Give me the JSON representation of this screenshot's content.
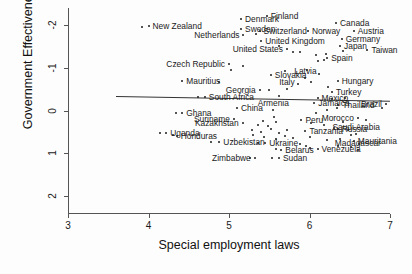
{
  "chart_data": {
    "type": "scatter",
    "title": "",
    "xlabel": "Special employment laws",
    "ylabel": "Government Effectiveness",
    "xlim": [
      3,
      7
    ],
    "ylim": [
      -2.4,
      2.4
    ],
    "xticks": [
      3,
      4,
      5,
      6,
      7
    ],
    "yticks": [
      -2,
      -1,
      0,
      1,
      2
    ],
    "grid": false,
    "legend": "none",
    "fit_line": {
      "type": "linear",
      "x_start": 3.6,
      "x_end": 7.0,
      "y_start": 0.33,
      "y_end": 0.22
    },
    "points": [
      {
        "label": "New Zealand",
        "x": 4.0,
        "y": 1.97,
        "label_pos": "left"
      },
      {
        "label": "Denmark",
        "x": 5.15,
        "y": 2.14,
        "label_pos": "left"
      },
      {
        "label": "Finland",
        "x": 5.47,
        "y": 2.22,
        "label_pos": "left"
      },
      {
        "label": "Sweden",
        "x": 5.15,
        "y": 1.92,
        "label_pos": "left"
      },
      {
        "label": "Netherlands",
        "x": 5.18,
        "y": 1.77,
        "label_pos": "right"
      },
      {
        "label": "Switzerland",
        "x": 5.38,
        "y": 1.86,
        "label_pos": "left"
      },
      {
        "label": "Norway",
        "x": 5.98,
        "y": 1.86,
        "label_pos": "left"
      },
      {
        "label": "Canada",
        "x": 6.33,
        "y": 2.05,
        "label_pos": "left"
      },
      {
        "label": "Austria",
        "x": 6.55,
        "y": 1.86,
        "label_pos": "left"
      },
      {
        "label": "Germany",
        "x": 6.4,
        "y": 1.68,
        "label_pos": "left"
      },
      {
        "label": "Japan",
        "x": 6.38,
        "y": 1.5,
        "label_pos": "left"
      },
      {
        "label": "Taiwan",
        "x": 6.72,
        "y": 1.42,
        "label_pos": "left"
      },
      {
        "label": "United Kingdom",
        "x": 5.4,
        "y": 1.62,
        "label_pos": "left"
      },
      {
        "label": "United States",
        "x": 5.72,
        "y": 1.44,
        "label_pos": "right"
      },
      {
        "label": "Spain",
        "x": 6.22,
        "y": 1.24,
        "label_pos": "left"
      },
      {
        "label": "Czech Republic",
        "x": 5.0,
        "y": 1.08,
        "label_pos": "right"
      },
      {
        "label": "Slovakia",
        "x": 5.52,
        "y": 0.84,
        "label_pos": "left"
      },
      {
        "label": "Latvia",
        "x": 5.95,
        "y": 0.75,
        "label_pos": "mid"
      },
      {
        "label": "Hungary",
        "x": 6.35,
        "y": 0.7,
        "label_pos": "left"
      },
      {
        "label": "Mauritius",
        "x": 4.42,
        "y": 0.68,
        "label_pos": "left"
      },
      {
        "label": "Georgia",
        "x": 5.38,
        "y": 0.48,
        "label_pos": "right"
      },
      {
        "label": "Italy",
        "x": 5.72,
        "y": 0.5,
        "label_pos": "mid"
      },
      {
        "label": "Turkey",
        "x": 6.28,
        "y": 0.43,
        "label_pos": "left"
      },
      {
        "label": "Mexico",
        "x": 6.1,
        "y": 0.29,
        "label_pos": "left"
      },
      {
        "label": "South Africa",
        "x": 4.7,
        "y": 0.32,
        "label_pos": "left"
      },
      {
        "label": "Jamaica",
        "x": 6.06,
        "y": 0.18,
        "label_pos": "left"
      },
      {
        "label": "Thailand",
        "x": 6.36,
        "y": 0.14,
        "label_pos": "left"
      },
      {
        "label": "Brazil",
        "x": 6.95,
        "y": 0.16,
        "label_pos": "right"
      },
      {
        "label": "China",
        "x": 5.1,
        "y": 0.07,
        "label_pos": "left"
      },
      {
        "label": "Armenia",
        "x": 5.55,
        "y": 0.02,
        "label_pos": "mid"
      },
      {
        "label": "Ghana",
        "x": 4.42,
        "y": -0.06,
        "label_pos": "left"
      },
      {
        "label": "Suriname",
        "x": 5.06,
        "y": -0.2,
        "label_pos": "right"
      },
      {
        "label": "Kazakhstan",
        "x": 5.17,
        "y": -0.3,
        "label_pos": "right"
      },
      {
        "label": "Peru",
        "x": 5.9,
        "y": -0.22,
        "label_pos": "left"
      },
      {
        "label": "Morocco",
        "x": 6.6,
        "y": -0.18,
        "label_pos": "right"
      },
      {
        "label": "Russia",
        "x": 6.35,
        "y": -0.43,
        "label_pos": "left"
      },
      {
        "label": "Saudi Arabia",
        "x": 6.58,
        "y": -0.55,
        "label_pos": "mid"
      },
      {
        "label": "Uganda",
        "x": 4.22,
        "y": -0.52,
        "label_pos": "left"
      },
      {
        "label": "Honduras",
        "x": 4.35,
        "y": -0.6,
        "label_pos": "left"
      },
      {
        "label": "Uzbekistan",
        "x": 4.88,
        "y": -0.74,
        "label_pos": "left"
      },
      {
        "label": "Ukraine",
        "x": 5.45,
        "y": -0.77,
        "label_pos": "left"
      },
      {
        "label": "Tanzania",
        "x": 5.95,
        "y": -0.47,
        "label_pos": "left"
      },
      {
        "label": "Mauritania",
        "x": 6.55,
        "y": -0.72,
        "label_pos": "left"
      },
      {
        "label": "Belarus",
        "x": 5.65,
        "y": -0.92,
        "label_pos": "left"
      },
      {
        "label": "Venezuela",
        "x": 6.1,
        "y": -0.9,
        "label_pos": "left"
      },
      {
        "label": "Madagascar",
        "x": 6.6,
        "y": -0.92,
        "label_pos": "mid"
      },
      {
        "label": "Zimbabwe",
        "x": 5.32,
        "y": -1.11,
        "label_pos": "right"
      },
      {
        "label": "Sudan",
        "x": 5.62,
        "y": -1.11,
        "label_pos": "left"
      }
    ],
    "extra_points": [
      {
        "x": 5.33,
        "y": 1.78
      },
      {
        "x": 5.62,
        "y": 1.52
      },
      {
        "x": 5.8,
        "y": 1.38
      },
      {
        "x": 5.88,
        "y": 1.36
      },
      {
        "x": 6.08,
        "y": 1.3
      },
      {
        "x": 6.2,
        "y": 1.33
      },
      {
        "x": 6.42,
        "y": 1.4
      },
      {
        "x": 6.1,
        "y": 1.16
      },
      {
        "x": 6.18,
        "y": 1.18
      },
      {
        "x": 5.97,
        "y": 0.94
      },
      {
        "x": 5.7,
        "y": 0.93
      },
      {
        "x": 6.12,
        "y": 0.86
      },
      {
        "x": 6.02,
        "y": 0.66
      },
      {
        "x": 5.86,
        "y": 0.62
      },
      {
        "x": 6.23,
        "y": 0.56
      },
      {
        "x": 5.5,
        "y": 0.49
      },
      {
        "x": 5.62,
        "y": 0.33
      },
      {
        "x": 6.28,
        "y": 0.27
      },
      {
        "x": 6.44,
        "y": 0.3
      },
      {
        "x": 6.34,
        "y": 0.06
      },
      {
        "x": 6.22,
        "y": 0.02
      },
      {
        "x": 6.08,
        "y": -0.05
      },
      {
        "x": 5.56,
        "y": -0.15
      },
      {
        "x": 5.42,
        "y": -0.24
      },
      {
        "x": 5.58,
        "y": -0.28
      },
      {
        "x": 5.36,
        "y": -0.33
      },
      {
        "x": 5.48,
        "y": -0.36
      },
      {
        "x": 6.02,
        "y": -0.3
      },
      {
        "x": 6.42,
        "y": -0.26
      },
      {
        "x": 6.18,
        "y": -0.33
      },
      {
        "x": 6.3,
        "y": -0.4
      },
      {
        "x": 5.28,
        "y": -0.46
      },
      {
        "x": 5.4,
        "y": -0.5
      },
      {
        "x": 5.52,
        "y": -0.44
      },
      {
        "x": 5.62,
        "y": -0.52
      },
      {
        "x": 5.72,
        "y": -0.46
      },
      {
        "x": 5.3,
        "y": -0.58
      },
      {
        "x": 5.44,
        "y": -0.62
      },
      {
        "x": 5.58,
        "y": -0.66
      },
      {
        "x": 5.7,
        "y": -0.6
      },
      {
        "x": 5.8,
        "y": -0.64
      },
      {
        "x": 6.0,
        "y": -0.62
      },
      {
        "x": 6.22,
        "y": -0.7
      },
      {
        "x": 6.38,
        "y": -0.66
      },
      {
        "x": 6.62,
        "y": -0.78
      },
      {
        "x": 5.88,
        "y": -0.78
      },
      {
        "x": 5.96,
        "y": -0.84
      },
      {
        "x": 6.52,
        "y": -0.86
      },
      {
        "x": 6.36,
        "y": -0.82
      },
      {
        "x": 5.18,
        "y": 1.05
      },
      {
        "x": 5.02,
        "y": 0.96
      },
      {
        "x": 4.88,
        "y": 0.66
      },
      {
        "x": 4.62,
        "y": 0.31
      },
      {
        "x": 3.92,
        "y": 1.96
      },
      {
        "x": 4.34,
        "y": -0.07
      },
      {
        "x": 4.14,
        "y": -0.52
      },
      {
        "x": 4.3,
        "y": -0.57
      },
      {
        "x": 4.78,
        "y": -0.74
      },
      {
        "x": 5.36,
        "y": -0.76
      },
      {
        "x": 5.58,
        "y": -0.9
      },
      {
        "x": 6.0,
        "y": -0.88
      },
      {
        "x": 5.26,
        "y": -1.11
      },
      {
        "x": 5.54,
        "y": -1.12
      },
      {
        "x": 6.9,
        "y": 0.07
      },
      {
        "x": 6.7,
        "y": -0.22
      },
      {
        "x": 6.48,
        "y": -0.46
      },
      {
        "x": 6.52,
        "y": -0.58
      }
    ]
  },
  "axis": {
    "x_tick_labels": [
      "3",
      "4",
      "5",
      "6",
      "7"
    ],
    "y_tick_labels": [
      "2",
      "1",
      "0",
      "-1",
      "-2"
    ],
    "x_title": "Special employment laws",
    "y_title": "Government Effectiveness"
  },
  "style": {
    "point_color": "#1c1c1c",
    "axis_color": "#555555",
    "text_color": "#1a1a1a",
    "background": "#fdfdfd"
  }
}
